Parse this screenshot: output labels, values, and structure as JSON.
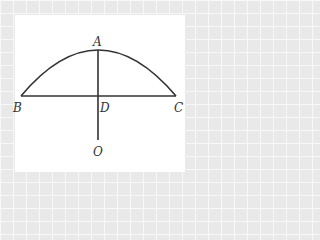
{
  "diagram": {
    "type": "geometry",
    "colors": {
      "background": "#e9e9e9",
      "panel": "#ffffff",
      "stroke": "#333333"
    },
    "points": {
      "A": {
        "label": "A",
        "x": 98,
        "y": 50
      },
      "B": {
        "label": "B",
        "x": 21,
        "y": 96
      },
      "C": {
        "label": "C",
        "x": 176,
        "y": 96
      },
      "D": {
        "label": "D",
        "x": 98,
        "y": 96
      },
      "O": {
        "label": "O",
        "x": 98,
        "y": 140
      }
    },
    "segments": [
      {
        "from": "B",
        "to": "C",
        "name": "chord-BC"
      },
      {
        "from": "A",
        "to": "O",
        "name": "segment-AO"
      }
    ],
    "arcs": [
      {
        "from": "B",
        "through": "A",
        "to": "C",
        "name": "arc-BAC"
      }
    ]
  }
}
